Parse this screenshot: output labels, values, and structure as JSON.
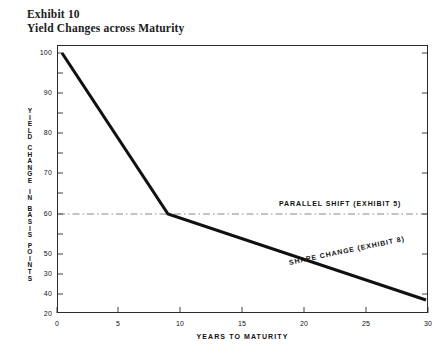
{
  "title": {
    "exhibit": "Exhibit 10",
    "name": "Yield Changes across Maturity"
  },
  "chart_data": {
    "type": "line",
    "title": "Yield Changes across Maturity",
    "subtitle": "Exhibit 10",
    "xlabel": "YEARS TO MATURITY",
    "ylabel": "YIELD CHANGE IN BASIS POINTS",
    "xlim": [
      0,
      30
    ],
    "ylim": [
      15,
      104
    ],
    "xticks": [
      0,
      5,
      10,
      15,
      20,
      25,
      30
    ],
    "xtick_labels": [
      "0",
      "5",
      "10",
      "15",
      "20",
      "25",
      "30"
    ],
    "yticks": [
      20,
      30,
      40,
      50,
      60,
      70,
      80,
      90,
      100
    ],
    "ytick_labels": [
      "20",
      "30",
      "40",
      "50",
      "60",
      "70",
      "80",
      "90",
      "100"
    ],
    "grid": false,
    "legend": "annotations-inline",
    "series": [
      {
        "name": "SHAPE CHANGE (EXHIBIT 8)",
        "style": "solid",
        "linewidth": 3.1,
        "color": "#111111",
        "x": [
          1,
          9,
          30
        ],
        "y": [
          100,
          50,
          24
        ]
      },
      {
        "name": "PARALLEL SHIFT (EXHIBIT 5)",
        "style": "dash-dot",
        "linewidth": 0.8,
        "color": "#555555",
        "x": [
          0,
          30
        ],
        "y": [
          50,
          50
        ]
      }
    ],
    "annotations": [
      {
        "text": "PARALLEL SHIFT  (EXHIBIT 5)",
        "x": 18.0,
        "y": 53
      },
      {
        "text": "SHAPE CHANGE  (EXHIBIT 8)",
        "x": 18.8,
        "y": 35
      }
    ]
  },
  "axis_label_chars": {
    "y": [
      "Y",
      "I",
      "E",
      "L",
      "D",
      "",
      "C",
      "H",
      "A",
      "N",
      "G",
      "E",
      "",
      "I",
      "N",
      "",
      "B",
      "A",
      "S",
      "I",
      "S",
      "",
      "P",
      "O",
      "I",
      "N",
      "T",
      "S"
    ]
  }
}
